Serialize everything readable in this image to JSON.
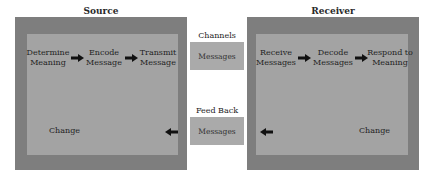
{
  "source": {
    "title": "Source",
    "steps": [
      "Determine\nMeaning",
      "Encode\nMessage",
      "Transmit\nMessage"
    ],
    "step_lines": [
      [
        "Determine",
        "Meaning"
      ],
      [
        "Encode",
        "Message"
      ],
      [
        "Transmit",
        "Message"
      ]
    ],
    "change_label": "Change"
  },
  "receiver": {
    "title": "Receiver",
    "step_lines": [
      [
        "Receive",
        "Messages"
      ],
      [
        "Decode",
        "Messages"
      ],
      [
        "Respond to",
        "Meaning"
      ]
    ],
    "change_label": "Change"
  },
  "channels": {
    "label": "Channels",
    "box_label": "Messages"
  },
  "feedback": {
    "label": "Feed Back",
    "box_label": "Messages"
  },
  "colors": {
    "outer": "#7e7e7e",
    "inner": "#a3a3a3",
    "message_box": "#aaaaaa",
    "arrow": "#111111"
  }
}
